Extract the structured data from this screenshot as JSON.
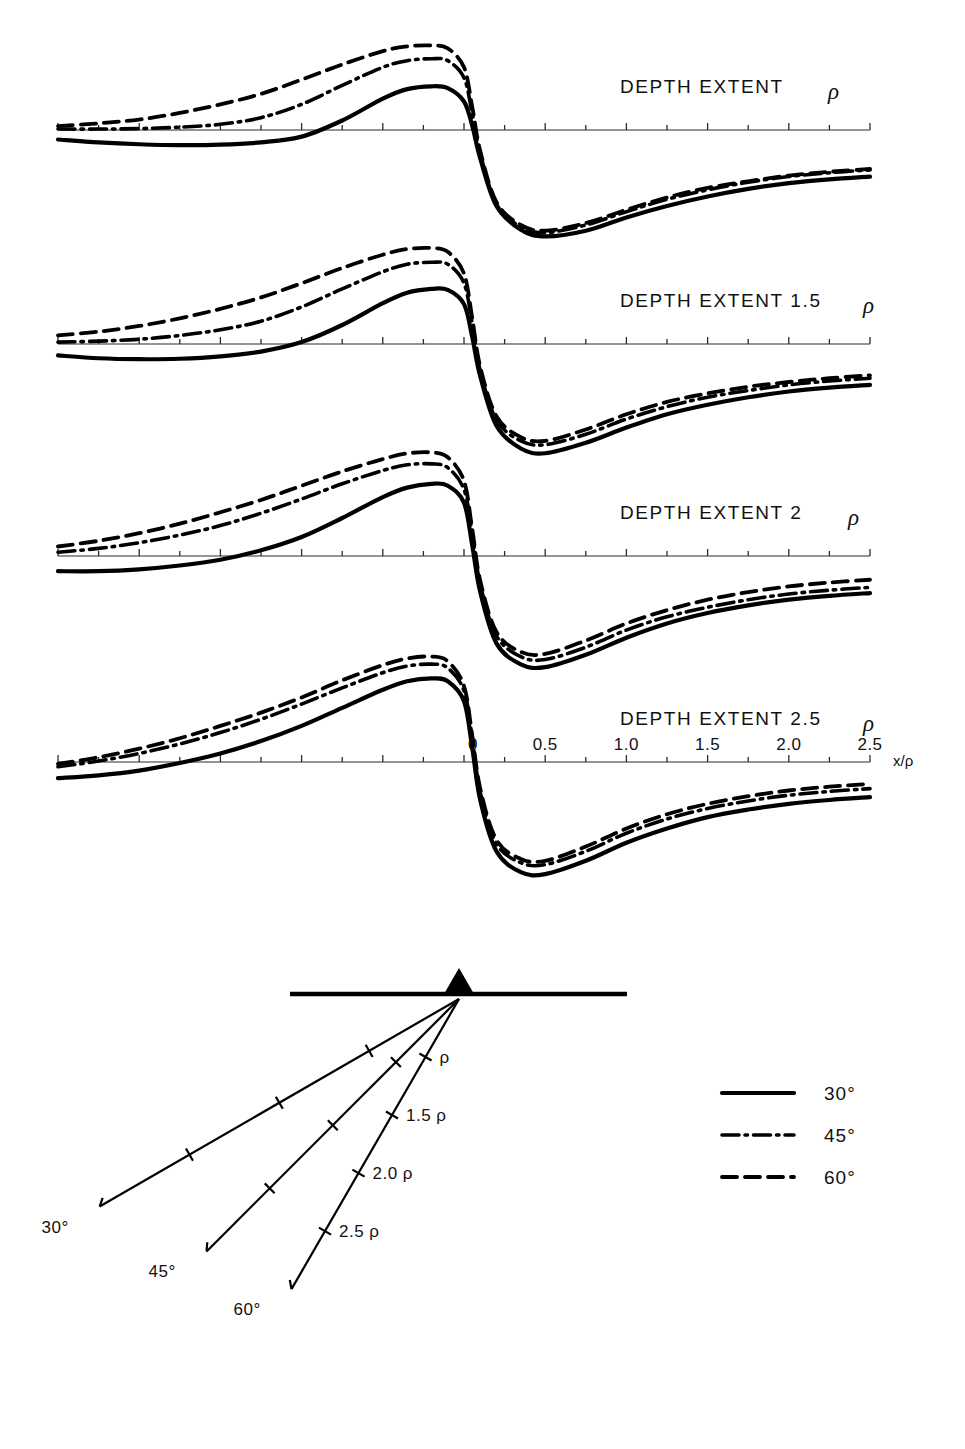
{
  "chart_data": {
    "type": "line",
    "title": "",
    "xlabel": "x/ρ",
    "ylabel": "",
    "xlim": [
      -2.5,
      2.5
    ],
    "grid": false,
    "legend_position": "bottom-right",
    "x_tick_labels": [
      "0",
      "0.5",
      "1.0",
      "1.5",
      "2.0",
      "2.5"
    ],
    "x_tick_values": [
      0,
      0.5,
      1.0,
      1.5,
      2.0,
      2.5
    ],
    "x_minor_tick_step": 0.25,
    "legend": [
      {
        "label": "30°",
        "style": "solid"
      },
      {
        "label": "45°",
        "style": "dash-dot"
      },
      {
        "label": "60°",
        "style": "dashed"
      }
    ],
    "panels": [
      {
        "label_prefix": "DEPTH EXTENT",
        "label_value": "",
        "label_rho": "ρ",
        "series": [
          {
            "name": "30°",
            "style": "solid",
            "x": [
              -2.5,
              -2.25,
              -2.0,
              -1.75,
              -1.5,
              -1.25,
              -1.0,
              -0.75,
              -0.5,
              -0.35,
              -0.2,
              -0.1,
              0,
              0.05,
              0.1,
              0.2,
              0.35,
              0.5,
              0.75,
              1.0,
              1.25,
              1.5,
              1.75,
              2.0,
              2.25,
              2.5
            ],
            "y": [
              -0.1,
              -0.13,
              -0.15,
              -0.16,
              -0.155,
              -0.13,
              -0.07,
              0.1,
              0.33,
              0.43,
              0.46,
              0.44,
              0.3,
              0.05,
              -0.3,
              -0.8,
              -1.05,
              -1.12,
              -1.06,
              -0.92,
              -0.8,
              -0.7,
              -0.62,
              -0.56,
              -0.52,
              -0.49
            ]
          },
          {
            "name": "45°",
            "style": "dash-dot",
            "x": [
              -2.5,
              -2.25,
              -2.0,
              -1.75,
              -1.5,
              -1.25,
              -1.0,
              -0.75,
              -0.5,
              -0.35,
              -0.2,
              -0.1,
              0,
              0.05,
              0.1,
              0.2,
              0.35,
              0.5,
              0.75,
              1.0,
              1.25,
              1.5,
              1.75,
              2.0,
              2.25,
              2.5
            ],
            "y": [
              0.01,
              0.01,
              0.015,
              0.03,
              0.06,
              0.13,
              0.27,
              0.47,
              0.66,
              0.73,
              0.75,
              0.73,
              0.55,
              0.18,
              -0.25,
              -0.78,
              -1.02,
              -1.08,
              -1.0,
              -0.86,
              -0.73,
              -0.63,
              -0.55,
              -0.49,
              -0.45,
              -0.42
            ]
          },
          {
            "name": "60°",
            "style": "dashed",
            "x": [
              -2.5,
              -2.25,
              -2.0,
              -1.75,
              -1.5,
              -1.25,
              -1.0,
              -0.75,
              -0.5,
              -0.35,
              -0.2,
              -0.1,
              0,
              0.05,
              0.1,
              0.2,
              0.35,
              0.5,
              0.75,
              1.0,
              1.25,
              1.5,
              1.75,
              2.0,
              2.25,
              2.5
            ],
            "y": [
              0.04,
              0.07,
              0.11,
              0.18,
              0.27,
              0.38,
              0.53,
              0.69,
              0.83,
              0.88,
              0.89,
              0.86,
              0.66,
              0.25,
              -0.22,
              -0.76,
              -1.0,
              -1.06,
              -0.98,
              -0.84,
              -0.71,
              -0.61,
              -0.54,
              -0.48,
              -0.44,
              -0.41
            ]
          }
        ]
      },
      {
        "label_prefix": "DEPTH EXTENT",
        "label_value": "1.5",
        "label_rho": "ρ",
        "series": [
          {
            "name": "30°",
            "style": "solid",
            "x": [
              -2.5,
              -2.25,
              -2.0,
              -1.75,
              -1.5,
              -1.25,
              -1.0,
              -0.75,
              -0.5,
              -0.35,
              -0.2,
              -0.1,
              0,
              0.05,
              0.1,
              0.2,
              0.35,
              0.5,
              0.75,
              1.0,
              1.25,
              1.5,
              1.75,
              2.0,
              2.25,
              2.5
            ],
            "y": [
              -0.12,
              -0.15,
              -0.16,
              -0.155,
              -0.13,
              -0.08,
              0.02,
              0.2,
              0.43,
              0.54,
              0.58,
              0.57,
              0.42,
              0.08,
              -0.34,
              -0.86,
              -1.1,
              -1.15,
              -1.04,
              -0.88,
              -0.74,
              -0.64,
              -0.56,
              -0.5,
              -0.46,
              -0.43
            ]
          },
          {
            "name": "45°",
            "style": "dash-dot",
            "x": [
              -2.5,
              -2.25,
              -2.0,
              -1.75,
              -1.5,
              -1.25,
              -1.0,
              -0.75,
              -0.5,
              -0.35,
              -0.2,
              -0.1,
              0,
              0.05,
              0.1,
              0.2,
              0.35,
              0.5,
              0.75,
              1.0,
              1.25,
              1.5,
              1.75,
              2.0,
              2.25,
              2.5
            ],
            "y": [
              0.02,
              0.03,
              0.05,
              0.09,
              0.15,
              0.24,
              0.39,
              0.58,
              0.76,
              0.84,
              0.86,
              0.84,
              0.64,
              0.22,
              -0.28,
              -0.8,
              -1.02,
              -1.06,
              -0.95,
              -0.79,
              -0.66,
              -0.56,
              -0.49,
              -0.43,
              -0.39,
              -0.36
            ]
          },
          {
            "name": "60°",
            "style": "dashed",
            "x": [
              -2.5,
              -2.25,
              -2.0,
              -1.75,
              -1.5,
              -1.25,
              -1.0,
              -0.75,
              -0.5,
              -0.35,
              -0.2,
              -0.1,
              0,
              0.05,
              0.1,
              0.2,
              0.35,
              0.5,
              0.75,
              1.0,
              1.25,
              1.5,
              1.75,
              2.0,
              2.25,
              2.5
            ],
            "y": [
              0.09,
              0.13,
              0.19,
              0.27,
              0.37,
              0.49,
              0.64,
              0.8,
              0.94,
              1.0,
              1.01,
              0.97,
              0.74,
              0.28,
              -0.24,
              -0.76,
              -0.98,
              -1.02,
              -0.9,
              -0.74,
              -0.61,
              -0.52,
              -0.45,
              -0.4,
              -0.36,
              -0.33
            ]
          }
        ]
      },
      {
        "label_prefix": "DEPTH EXTENT",
        "label_value": "2",
        "label_rho": "ρ",
        "series": [
          {
            "name": "30°",
            "style": "solid",
            "x": [
              -2.5,
              -2.25,
              -2.0,
              -1.75,
              -1.5,
              -1.25,
              -1.0,
              -0.75,
              -0.5,
              -0.35,
              -0.2,
              -0.1,
              0,
              0.05,
              0.1,
              0.2,
              0.35,
              0.5,
              0.75,
              1.0,
              1.25,
              1.5,
              1.75,
              2.0,
              2.25,
              2.5
            ],
            "y": [
              -0.16,
              -0.16,
              -0.14,
              -0.1,
              -0.04,
              0.06,
              0.2,
              0.4,
              0.62,
              0.72,
              0.76,
              0.74,
              0.56,
              0.12,
              -0.38,
              -0.92,
              -1.14,
              -1.17,
              -1.04,
              -0.86,
              -0.71,
              -0.6,
              -0.52,
              -0.46,
              -0.42,
              -0.39
            ]
          },
          {
            "name": "45°",
            "style": "dash-dot",
            "x": [
              -2.5,
              -2.25,
              -2.0,
              -1.75,
              -1.5,
              -1.25,
              -1.0,
              -0.75,
              -0.5,
              -0.35,
              -0.2,
              -0.1,
              0,
              0.05,
              0.1,
              0.2,
              0.35,
              0.5,
              0.75,
              1.0,
              1.25,
              1.5,
              1.75,
              2.0,
              2.25,
              2.5
            ],
            "y": [
              0.04,
              0.08,
              0.14,
              0.22,
              0.32,
              0.45,
              0.6,
              0.76,
              0.9,
              0.96,
              0.97,
              0.93,
              0.7,
              0.24,
              -0.3,
              -0.84,
              -1.06,
              -1.09,
              -0.96,
              -0.78,
              -0.64,
              -0.54,
              -0.46,
              -0.4,
              -0.36,
              -0.33
            ]
          },
          {
            "name": "60°",
            "style": "dashed",
            "x": [
              -2.5,
              -2.25,
              -2.0,
              -1.75,
              -1.5,
              -1.25,
              -1.0,
              -0.75,
              -0.5,
              -0.35,
              -0.2,
              -0.1,
              0,
              0.05,
              0.1,
              0.2,
              0.35,
              0.5,
              0.75,
              1.0,
              1.25,
              1.5,
              1.75,
              2.0,
              2.25,
              2.5
            ],
            "y": [
              0.1,
              0.16,
              0.24,
              0.34,
              0.46,
              0.59,
              0.74,
              0.89,
              1.02,
              1.08,
              1.09,
              1.04,
              0.79,
              0.29,
              -0.26,
              -0.8,
              -1.01,
              -1.03,
              -0.89,
              -0.71,
              -0.57,
              -0.46,
              -0.38,
              -0.32,
              -0.28,
              -0.25
            ]
          }
        ]
      },
      {
        "label_prefix": "DEPTH EXTENT",
        "label_value": "2.5",
        "label_rho": "ρ",
        "series": [
          {
            "name": "30°",
            "style": "solid",
            "x": [
              -2.5,
              -2.25,
              -2.0,
              -1.75,
              -1.5,
              -1.25,
              -1.0,
              -0.75,
              -0.5,
              -0.35,
              -0.2,
              -0.1,
              0,
              0.05,
              0.1,
              0.2,
              0.35,
              0.5,
              0.75,
              1.0,
              1.25,
              1.5,
              1.75,
              2.0,
              2.25,
              2.5
            ],
            "y": [
              -0.17,
              -0.14,
              -0.09,
              -0.01,
              0.09,
              0.22,
              0.38,
              0.57,
              0.76,
              0.85,
              0.88,
              0.85,
              0.64,
              0.16,
              -0.4,
              -0.94,
              -1.16,
              -1.18,
              -1.04,
              -0.85,
              -0.7,
              -0.58,
              -0.5,
              -0.44,
              -0.4,
              -0.37
            ]
          },
          {
            "name": "45°",
            "style": "dash-dot",
            "x": [
              -2.5,
              -2.25,
              -2.0,
              -1.75,
              -1.5,
              -1.25,
              -1.0,
              -0.75,
              -0.5,
              -0.35,
              -0.2,
              -0.1,
              0,
              0.05,
              0.1,
              0.2,
              0.35,
              0.5,
              0.75,
              1.0,
              1.25,
              1.5,
              1.75,
              2.0,
              2.25,
              2.5
            ],
            "y": [
              -0.05,
              0.01,
              0.09,
              0.19,
              0.31,
              0.45,
              0.61,
              0.78,
              0.94,
              1.01,
              1.03,
              0.99,
              0.75,
              0.26,
              -0.32,
              -0.86,
              -1.06,
              -1.08,
              -0.94,
              -0.75,
              -0.6,
              -0.49,
              -0.41,
              -0.35,
              -0.31,
              -0.28
            ]
          },
          {
            "name": "60°",
            "style": "dashed",
            "x": [
              -2.5,
              -2.25,
              -2.0,
              -1.75,
              -1.5,
              -1.25,
              -1.0,
              -0.75,
              -0.5,
              -0.35,
              -0.2,
              -0.1,
              0,
              0.05,
              0.1,
              0.2,
              0.35,
              0.5,
              0.75,
              1.0,
              1.25,
              1.5,
              1.75,
              2.0,
              2.25,
              2.5
            ],
            "y": [
              -0.02,
              0.05,
              0.14,
              0.25,
              0.38,
              0.52,
              0.68,
              0.86,
              1.02,
              1.09,
              1.11,
              1.06,
              0.8,
              0.29,
              -0.28,
              -0.82,
              -1.02,
              -1.04,
              -0.89,
              -0.7,
              -0.55,
              -0.44,
              -0.36,
              -0.3,
              -0.26,
              -0.23
            ]
          }
        ]
      }
    ]
  },
  "diagram": {
    "name": "source-geometry-diagram",
    "surface_label": "",
    "body_marker": "filled-triangle",
    "rays": [
      {
        "angle_label": "30°",
        "dip_deg": 30,
        "ticks": [
          "",
          "",
          ""
        ]
      },
      {
        "angle_label": "45°",
        "dip_deg": 45,
        "ticks": [
          "",
          "",
          ""
        ]
      },
      {
        "angle_label": "60°",
        "dip_deg": 60,
        "ticks": [
          "ρ",
          "1.5 ρ",
          "2.0 ρ",
          "2.5 ρ"
        ]
      }
    ],
    "depth_marks": [
      {
        "label": "ρ"
      },
      {
        "label": "1.5 ρ"
      },
      {
        "label": "2.0 ρ"
      },
      {
        "label": "2.5 ρ"
      }
    ]
  },
  "colors": {
    "ink": "#000000",
    "axis": "#2a2a2a",
    "background": "#ffffff"
  }
}
